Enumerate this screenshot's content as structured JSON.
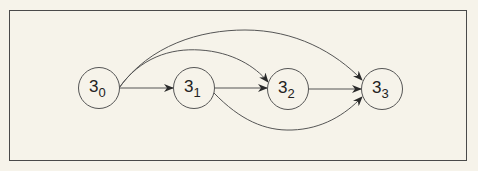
{
  "diagram": {
    "type": "directed-graph",
    "nodes": [
      {
        "id": "s0",
        "base": "3",
        "sub": "0",
        "cx": 99,
        "cy": 88
      },
      {
        "id": "s1",
        "base": "3",
        "sub": "1",
        "cx": 194,
        "cy": 88
      },
      {
        "id": "s2",
        "base": "3",
        "sub": "2",
        "cx": 288,
        "cy": 89
      },
      {
        "id": "s3",
        "base": "3",
        "sub": "3",
        "cx": 382,
        "cy": 89
      }
    ],
    "edges": [
      {
        "from": "s0",
        "to": "s1",
        "shape": "straight"
      },
      {
        "from": "s1",
        "to": "s2",
        "shape": "straight"
      },
      {
        "from": "s2",
        "to": "s3",
        "shape": "straight"
      },
      {
        "from": "s0",
        "to": "s2",
        "shape": "arc-above"
      },
      {
        "from": "s0",
        "to": "s3",
        "shape": "arc-above"
      },
      {
        "from": "s1",
        "to": "s3",
        "shape": "arc-below"
      }
    ],
    "colors": {
      "background": "#f6f3ea",
      "stroke": "#4a4a4a",
      "text": "#222222"
    }
  }
}
